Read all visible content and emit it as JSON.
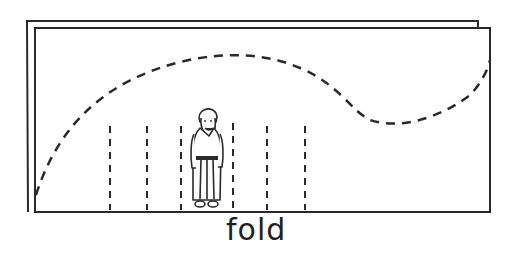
{
  "diagram": {
    "caption": "fold",
    "stroke_color": "#2a2a2a",
    "background": "#ffffff",
    "elements": {
      "back_sheet": "outer paper sheet",
      "front_sheet": "inner paper sheet",
      "curve": "dashed curve",
      "fold_lines_count": 6,
      "figure": "standing robed figure"
    }
  }
}
